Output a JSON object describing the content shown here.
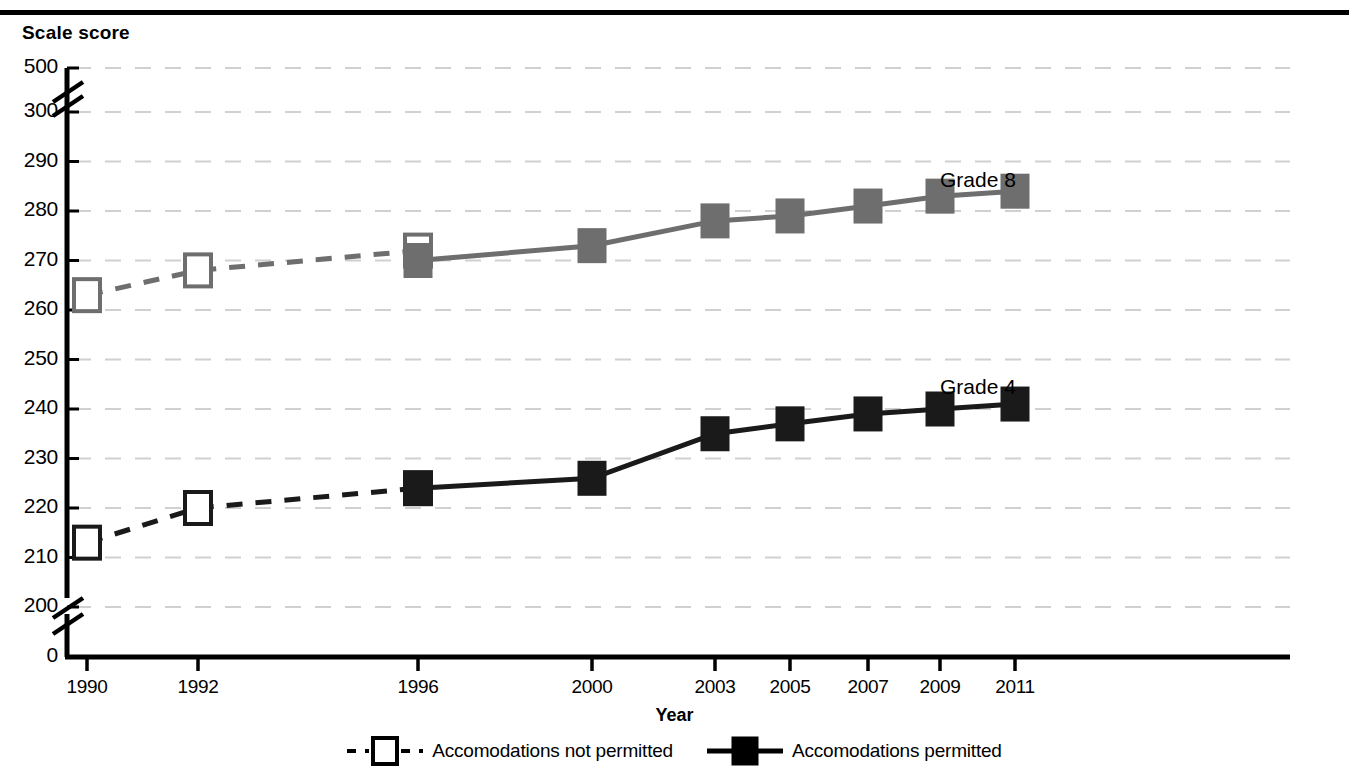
{
  "axis_title_y": "Scale score",
  "axis_title_x": "Year",
  "legend": {
    "items": [
      {
        "label": "Accomodations not permitted",
        "marker": "open-square",
        "line": "dashed",
        "color": "#000000"
      },
      {
        "label": "Accomodations permitted",
        "marker": "filled-square",
        "line": "solid",
        "color": "#000000"
      }
    ]
  },
  "annotations": [
    {
      "text": "Grade 8",
      "x": 940,
      "y": 168
    },
    {
      "text": "Grade 4",
      "x": 940,
      "y": 375
    }
  ],
  "colors": {
    "grade8": "#6e6e6e",
    "grade4": "#1a1a1a",
    "grid": "#d0d0d0",
    "axis": "#000000",
    "background": "#ffffff"
  },
  "chart_data": {
    "type": "line",
    "title": "",
    "xlabel": "Year",
    "ylabel": "Scale score",
    "x": [
      "1990",
      "1992",
      "1996",
      "2000",
      "2003",
      "2005",
      "2007",
      "2009",
      "2011"
    ],
    "ytick_labels": [
      "500",
      "300",
      "290",
      "280",
      "270",
      "260",
      "250",
      "240",
      "230",
      "220",
      "210",
      "200",
      "0"
    ],
    "ylim": [
      200,
      300
    ],
    "axis_breaks": [
      "between 300 and 500",
      "between 0 and 200"
    ],
    "grid": "horizontal dashed light gray",
    "legend_position": "below plot, centered",
    "series": [
      {
        "name": "Grade 8 — Accomodations not permitted",
        "grade": "Grade 8",
        "accommodations": "not permitted",
        "style": "dashed line, open square markers",
        "color": "#6e6e6e",
        "x": [
          "1990",
          "1992",
          "1996"
        ],
        "values": [
          263,
          268,
          272
        ]
      },
      {
        "name": "Grade 8 — Accomodations permitted",
        "grade": "Grade 8",
        "accommodations": "permitted",
        "style": "solid line, filled square markers",
        "color": "#6e6e6e",
        "x": [
          "1996",
          "2000",
          "2003",
          "2005",
          "2007",
          "2009",
          "2011"
        ],
        "values": [
          270,
          273,
          278,
          279,
          281,
          283,
          284
        ]
      },
      {
        "name": "Grade 4 — Accomodations not permitted",
        "grade": "Grade 4",
        "accommodations": "not permitted",
        "style": "dashed line, open square markers",
        "color": "#1a1a1a",
        "x": [
          "1990",
          "1992",
          "1996"
        ],
        "values": [
          213,
          220,
          224
        ]
      },
      {
        "name": "Grade 4 — Accomodations permitted",
        "grade": "Grade 4",
        "accommodations": "permitted",
        "style": "solid line, filled square markers",
        "color": "#1a1a1a",
        "x": [
          "1996",
          "2000",
          "2003",
          "2005",
          "2007",
          "2009",
          "2011"
        ],
        "values": [
          224,
          226,
          235,
          237,
          239,
          240,
          241
        ]
      }
    ]
  }
}
